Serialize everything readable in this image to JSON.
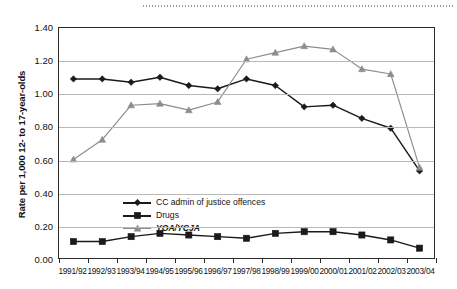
{
  "chart_data": {
    "type": "line",
    "title": "",
    "xlabel": "",
    "ylabel": "Rate per 1,000 12- to 17-year-olds",
    "ylim": [
      0.0,
      1.4
    ],
    "yticks": [
      "0.00",
      "0.20",
      "0.40",
      "0.60",
      "0.80",
      "1.00",
      "1.20",
      "1.40"
    ],
    "ytick_values": [
      0.0,
      0.2,
      0.4,
      0.6,
      0.8,
      1.0,
      1.2,
      1.4
    ],
    "grid": true,
    "legend_position": "inside-left",
    "categories": [
      "1991/92",
      "1992/93",
      "1993/94",
      "1994/95",
      "1995/96",
      "1996/97",
      "1997/98",
      "1998/99",
      "1999/00",
      "2000/01",
      "2001/02",
      "2002/03",
      "2003/04"
    ],
    "series": [
      {
        "name": "CC admin of justice offences",
        "marker": "diamond",
        "color": "#1a1a1a",
        "values": [
          1.09,
          1.09,
          1.07,
          1.1,
          1.05,
          1.03,
          1.09,
          1.05,
          0.92,
          0.93,
          0.85,
          0.79,
          0.53
        ]
      },
      {
        "name": "Drugs",
        "marker": "square",
        "color": "#1a1a1a",
        "values": [
          0.1,
          0.1,
          0.13,
          0.15,
          0.14,
          0.13,
          0.12,
          0.15,
          0.16,
          0.16,
          0.14,
          0.11,
          0.06
        ]
      },
      {
        "name": "YOA/YCJA",
        "marker": "triangle",
        "color": "#8c8c8c",
        "values": [
          0.6,
          0.72,
          0.93,
          0.94,
          0.9,
          0.95,
          1.21,
          1.25,
          1.29,
          1.27,
          1.15,
          1.12,
          0.55
        ]
      }
    ]
  },
  "legend": {
    "items": [
      {
        "label": "CC admin of justice offences",
        "italic": false
      },
      {
        "label": "Drugs",
        "italic": false
      },
      {
        "label": "YOA/YCJA",
        "italic": true
      }
    ]
  },
  "axis": {
    "y_title": "Rate per 1,000 12- to 17-year-olds"
  }
}
